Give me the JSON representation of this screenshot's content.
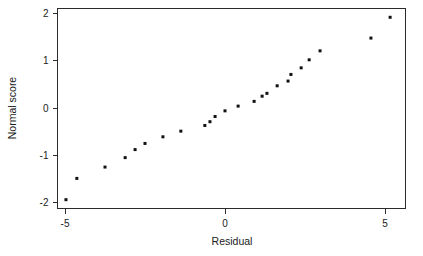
{
  "chart_data": {
    "type": "scatter",
    "title": "",
    "xlabel": "Residual",
    "ylabel": "Normal score",
    "xlim": [
      -5.9,
      5.9
    ],
    "ylim": [
      -2.25,
      2.2
    ],
    "xticks": [
      -5,
      0,
      5
    ],
    "xtick_labels": [
      "-5",
      "0",
      "5"
    ],
    "yticks": [
      -2,
      -1,
      0,
      1,
      2
    ],
    "ytick_labels": [
      "-2",
      "-1",
      "0",
      "1",
      "2"
    ],
    "grid": false,
    "legend": null,
    "marker": "square",
    "marker_color": "#111111",
    "marker_size": 3,
    "n_points": 24,
    "points": [
      {
        "x": -4.97,
        "y": -1.94
      },
      {
        "x": -4.63,
        "y": -1.49
      },
      {
        "x": -3.75,
        "y": -1.25
      },
      {
        "x": -3.12,
        "y": -1.05
      },
      {
        "x": -2.81,
        "y": -0.88
      },
      {
        "x": -2.5,
        "y": -0.75
      },
      {
        "x": -1.94,
        "y": -0.61
      },
      {
        "x": -1.38,
        "y": -0.49
      },
      {
        "x": -0.63,
        "y": -0.37
      },
      {
        "x": -0.47,
        "y": -0.29
      },
      {
        "x": -0.31,
        "y": -0.18
      },
      {
        "x": 0.0,
        "y": -0.06
      },
      {
        "x": 0.41,
        "y": 0.04
      },
      {
        "x": 0.91,
        "y": 0.14
      },
      {
        "x": 1.16,
        "y": 0.25
      },
      {
        "x": 1.31,
        "y": 0.31
      },
      {
        "x": 1.63,
        "y": 0.47
      },
      {
        "x": 1.97,
        "y": 0.57
      },
      {
        "x": 2.06,
        "y": 0.71
      },
      {
        "x": 2.38,
        "y": 0.85
      },
      {
        "x": 2.63,
        "y": 1.02
      },
      {
        "x": 2.97,
        "y": 1.21
      },
      {
        "x": 4.56,
        "y": 1.48
      },
      {
        "x": 5.16,
        "y": 1.92
      }
    ]
  },
  "axes": {
    "x_axis_title": "Residual",
    "y_axis_title": "Normal score"
  }
}
